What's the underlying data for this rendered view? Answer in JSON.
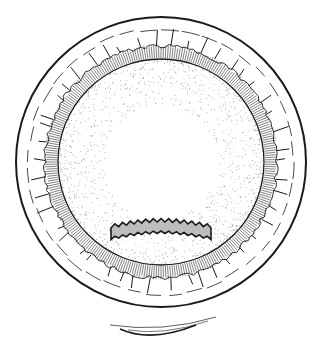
{
  "figure": {
    "description": "Line illustration of a circular cross-section: outer rim, dashed middle band with spiky projections, radially hatched ring, stippled inner disk containing a jagged elongated blob, and a small lens-shaped profile below",
    "width": 323,
    "height": 356,
    "center": [
      161,
      162
    ],
    "outer_radius": 145,
    "dashed_band_radius": 133,
    "hatch_outer_radius": 116,
    "inner_radius": 103,
    "colors": {
      "ink": "#1a1a1a",
      "stipple": "#6b6b6b",
      "background": "#ffffff"
    },
    "blob": {
      "cx": 161,
      "cy": 233,
      "length": 100,
      "thickness": 12
    },
    "lens_profile": {
      "cx": 163,
      "cy": 331,
      "width": 106
    }
  }
}
